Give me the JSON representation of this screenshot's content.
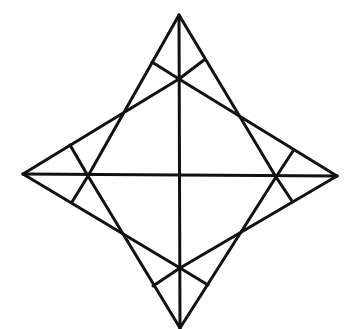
{
  "diagram": {
    "type": "four-pointed star geometric construction",
    "stroke_color": "#111111",
    "background": "#ffffff",
    "stroke_width": 3,
    "points": {
      "T": [
        179,
        15
      ],
      "R": [
        337,
        176
      ],
      "B": [
        180,
        328
      ],
      "L": [
        23,
        174
      ],
      "Ti": [
        179,
        79
      ],
      "Ri": [
        276,
        177
      ],
      "Bi": [
        180,
        268
      ],
      "Li": [
        88,
        176
      ],
      "t1": [
        152,
        62
      ],
      "t2": [
        204,
        60
      ],
      "r1": [
        293,
        151
      ],
      "r2": [
        292,
        201
      ],
      "b1": [
        153,
        286
      ],
      "b2": [
        208,
        285
      ],
      "l1": [
        70,
        145
      ],
      "l2": [
        72,
        202
      ]
    },
    "segments": [
      {
        "name": "edge-top-to-left-inner",
        "from": "T",
        "to": "Li"
      },
      {
        "name": "edge-top-to-right-inner",
        "from": "T",
        "to": "Ri"
      },
      {
        "name": "edge-right-to-top-inner",
        "from": "R",
        "to": "Ti"
      },
      {
        "name": "edge-right-to-bottom-inner",
        "from": "R",
        "to": "Bi"
      },
      {
        "name": "edge-bottom-to-left-inner",
        "from": "B",
        "to": "Li"
      },
      {
        "name": "edge-bottom-to-right-inner",
        "from": "B",
        "to": "Ri"
      },
      {
        "name": "edge-left-to-top-inner",
        "from": "L",
        "to": "Ti"
      },
      {
        "name": "edge-left-to-bottom-inner",
        "from": "L",
        "to": "Bi"
      },
      {
        "name": "axis-vertical",
        "from": "T",
        "to": "B"
      },
      {
        "name": "axis-horizontal",
        "from": "L",
        "to": "R"
      },
      {
        "name": "tick-top-left",
        "from": "Ti",
        "to": "t1"
      },
      {
        "name": "tick-top-right",
        "from": "Ti",
        "to": "t2"
      },
      {
        "name": "tick-right-top",
        "from": "Ri",
        "to": "r1"
      },
      {
        "name": "tick-right-bottom",
        "from": "Ri",
        "to": "r2"
      },
      {
        "name": "tick-bottom-left",
        "from": "Bi",
        "to": "b1"
      },
      {
        "name": "tick-bottom-right",
        "from": "Bi",
        "to": "b2"
      },
      {
        "name": "tick-left-top",
        "from": "Li",
        "to": "l1"
      },
      {
        "name": "tick-left-bottom",
        "from": "Li",
        "to": "l2"
      }
    ]
  }
}
